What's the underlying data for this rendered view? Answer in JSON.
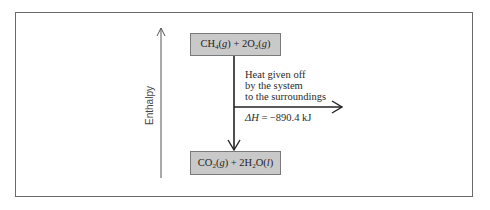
{
  "diagram": {
    "type": "enthalpy-diagram",
    "axis": {
      "label": "Enthalpy",
      "direction": "up"
    },
    "reactants": {
      "label": "CH4(g) + 2O2(g)",
      "parts": [
        "CH",
        "4",
        "(",
        "g",
        ") + 2O",
        "2",
        "(",
        "g",
        ")"
      ]
    },
    "products": {
      "label": "CO2(g) + 2H2O(l)",
      "parts": [
        "CO",
        "2",
        "(",
        "g",
        ") + 2H",
        "2",
        "O(",
        "l",
        ")"
      ]
    },
    "heat_flow": {
      "lines": [
        "Heat given off",
        "by the system",
        "to the surroundings"
      ]
    },
    "delta_h": {
      "symbol": "ΔH",
      "equals": " = ",
      "value": "−890.4 kJ"
    },
    "colors": {
      "box_fill": "#c9c9c9",
      "line": "#222222",
      "frame": "#6a6a6a"
    }
  }
}
